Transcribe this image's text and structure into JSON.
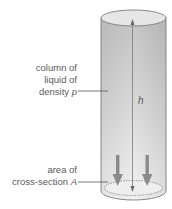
{
  "diagram": {
    "type": "liquid-column-pressure",
    "labels": {
      "column_line1": "column of",
      "column_line2": "liquid of",
      "column_line3": "density",
      "column_symbol": "p",
      "area_line1": "area of",
      "area_line2": "cross-section",
      "area_symbol": "A",
      "height_symbol": "h"
    },
    "colors": {
      "cylinder_fill_top": "#c8c8c8",
      "cylinder_fill_bottom": "#efefef",
      "cylinder_edge": "#7a7a7a",
      "ellipse_fill": "#e4e4e4",
      "arrow": "#8a8a8a",
      "leader_line": "#555555",
      "text": "#5a5a5a"
    }
  }
}
